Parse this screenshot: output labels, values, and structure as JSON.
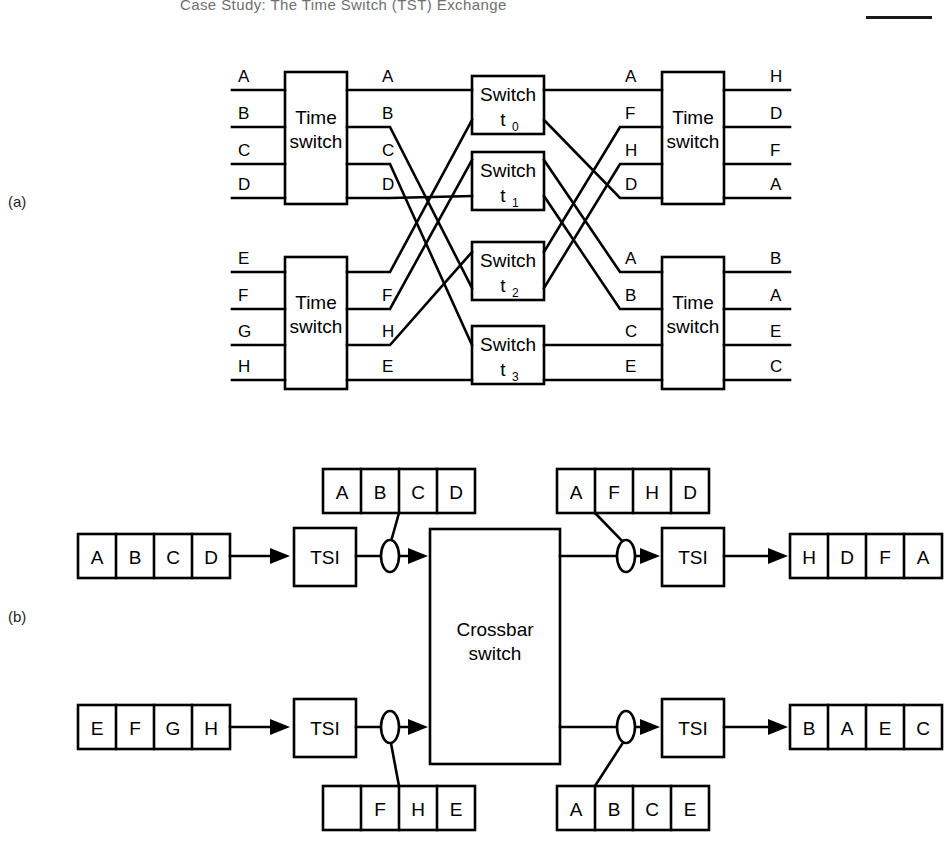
{
  "header": {
    "title": "Case Study: The Time Switch (TST) Exchange",
    "rule": ""
  },
  "panels": [
    {
      "id": "a",
      "label": "(a)"
    },
    {
      "id": "b",
      "label": "(b)"
    }
  ],
  "diagram_a": {
    "time_switches": [
      {
        "name": "time-switch-top-left",
        "label_line1": "Time",
        "label_line2": "switch",
        "inputs": [
          "A",
          "B",
          "C",
          "D"
        ],
        "outputs": [
          "A",
          "B",
          "C",
          "D"
        ]
      },
      {
        "name": "time-switch-bottom-left",
        "label_line1": "Time",
        "label_line2": "switch",
        "inputs": [
          "E",
          "F",
          "G",
          "H"
        ],
        "outputs": [
          "",
          "F",
          "H",
          "E"
        ]
      },
      {
        "name": "time-switch-top-right",
        "label_line1": "Time",
        "label_line2": "switch",
        "inputs": [
          "A",
          "F",
          "H",
          "D"
        ],
        "outputs": [
          "H",
          "D",
          "F",
          "A"
        ]
      },
      {
        "name": "time-switch-bottom-right",
        "label_line1": "Time",
        "label_line2": "switch",
        "inputs": [
          "A",
          "B",
          "C",
          "E"
        ],
        "outputs": [
          "B",
          "A",
          "E",
          "C"
        ]
      }
    ],
    "space_switches": [
      {
        "label": "Switch",
        "subscript": "t",
        "index": "0"
      },
      {
        "label": "Switch",
        "subscript": "t",
        "index": "1"
      },
      {
        "label": "Switch",
        "subscript": "t",
        "index": "2"
      },
      {
        "label": "Switch",
        "subscript": "t",
        "index": "3"
      }
    ]
  },
  "diagram_b": {
    "crossbar": {
      "label_line1": "Crossbar",
      "label_line2": "switch"
    },
    "tsi_label": "TSI",
    "rows": [
      {
        "name": "row-top",
        "input_frame": [
          "A",
          "B",
          "C",
          "D"
        ],
        "pre_callout_frame": [
          "A",
          "B",
          "C",
          "D"
        ],
        "post_callout_frame": [
          "A",
          "F",
          "H",
          "D"
        ],
        "output_frame": [
          "H",
          "D",
          "F",
          "A"
        ]
      },
      {
        "name": "row-bottom",
        "input_frame": [
          "E",
          "F",
          "G",
          "H"
        ],
        "pre_callout_frame": [
          "",
          "F",
          "H",
          "E"
        ],
        "post_callout_frame": [
          "A",
          "B",
          "C",
          "E"
        ],
        "output_frame": [
          "B",
          "A",
          "E",
          "C"
        ]
      }
    ]
  }
}
